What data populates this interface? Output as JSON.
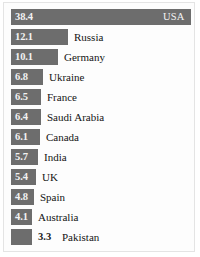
{
  "chart_data": {
    "type": "bar",
    "orientation": "horizontal",
    "title": "",
    "subtitle": "",
    "xlabel": "",
    "ylabel": "",
    "grid": false,
    "legend_position": "none",
    "axis_visible": false,
    "xlim": [
      0,
      38.4
    ],
    "categories": [
      "USA",
      "Russia",
      "Germany",
      "Ukraine",
      "France",
      "Saudi Arabia",
      "Canada",
      "India",
      "UK",
      "Spain",
      "Australia",
      "Pakistan"
    ],
    "values": [
      38.4,
      12.1,
      10.1,
      6.8,
      6.5,
      6.4,
      6.1,
      5.7,
      5.4,
      4.8,
      4.1,
      3.3
    ],
    "value_labels": [
      "38.4",
      "12.1",
      "10.1",
      "6.8",
      "6.5",
      "6.4",
      "6.1",
      "5.7",
      "5.4",
      "4.8",
      "4.1",
      "3.3"
    ],
    "bar_color": "#6d6d6d",
    "background_color": "#fdfdfd",
    "border_color": "#e4e4e4",
    "value_label_inside_color": "#f2f2f2",
    "value_label_outside_color": "#1a1a1a",
    "category_label_color": "#141414"
  },
  "rows": [
    {
      "value_label": "38.4",
      "category": "USA",
      "label_inside_bar": true,
      "category_inside_bar": true
    },
    {
      "value_label": "12.1",
      "category": "Russia",
      "label_inside_bar": true,
      "category_inside_bar": false
    },
    {
      "value_label": "10.1",
      "category": "Germany",
      "label_inside_bar": true,
      "category_inside_bar": false
    },
    {
      "value_label": "6.8",
      "category": "Ukraine",
      "label_inside_bar": true,
      "category_inside_bar": false
    },
    {
      "value_label": "6.5",
      "category": "France",
      "label_inside_bar": true,
      "category_inside_bar": false
    },
    {
      "value_label": "6.4",
      "category": "Saudi Arabia",
      "label_inside_bar": true,
      "category_inside_bar": false
    },
    {
      "value_label": "6.1",
      "category": "Canada",
      "label_inside_bar": true,
      "category_inside_bar": false
    },
    {
      "value_label": "5.7",
      "category": "India",
      "label_inside_bar": true,
      "category_inside_bar": false
    },
    {
      "value_label": "5.4",
      "category": "UK",
      "label_inside_bar": true,
      "category_inside_bar": false
    },
    {
      "value_label": "4.8",
      "category": "Spain",
      "label_inside_bar": true,
      "category_inside_bar": false
    },
    {
      "value_label": "4.1",
      "category": "Australia",
      "label_inside_bar": true,
      "category_inside_bar": false
    },
    {
      "value_label": "3.3",
      "category": "Pakistan",
      "label_inside_bar": false,
      "category_inside_bar": false
    }
  ]
}
